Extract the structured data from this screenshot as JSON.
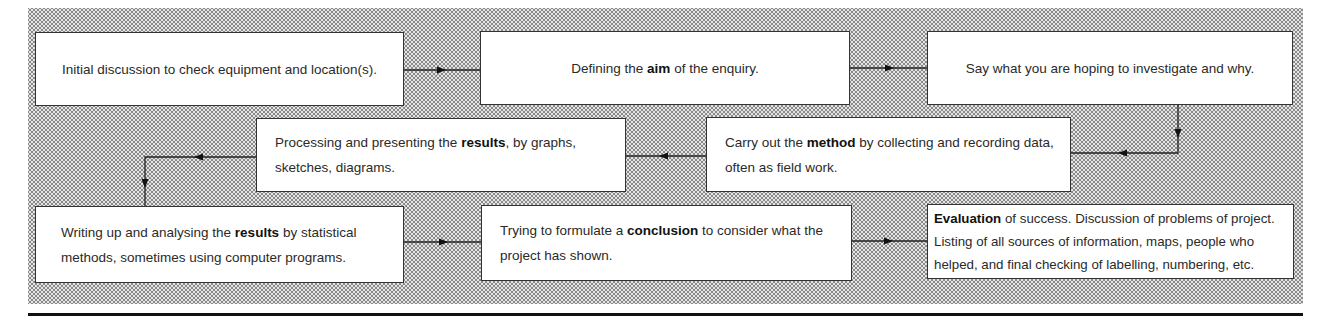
{
  "diagram": {
    "type": "flowchart",
    "steps": [
      {
        "id": 1,
        "pre": "Initial discussion to check equipment and location(s).",
        "bold": "",
        "post": ""
      },
      {
        "id": 2,
        "pre": "Defining the ",
        "bold": "aim",
        "post": " of the enquiry."
      },
      {
        "id": 3,
        "pre": "Say what you are hoping to investigate and why.",
        "bold": "",
        "post": ""
      },
      {
        "id": 4,
        "pre": "Carry out the ",
        "bold": "method",
        "post": " by collecting and recording data, often as field work."
      },
      {
        "id": 5,
        "pre": "Processing and presenting the ",
        "bold": "results",
        "post": ", by graphs, sketches, diagrams."
      },
      {
        "id": 6,
        "pre": "Writing up and analysing the ",
        "bold": "results",
        "post": " by statistical methods, sometimes using computer programs."
      },
      {
        "id": 7,
        "pre": "Trying to formulate a ",
        "bold": "conclusion",
        "post": " to consider what the project has shown."
      },
      {
        "id": 8,
        "pre": "",
        "bold": "Evaluation",
        "post": " of success. Discussion of problems of project. Listing of all sources of information, maps, people who helped, and final checking of labelling, numbering, etc."
      }
    ],
    "flow": [
      "1→2",
      "2→3",
      "3→4",
      "4→5",
      "5→6",
      "6→7",
      "7→8"
    ]
  }
}
